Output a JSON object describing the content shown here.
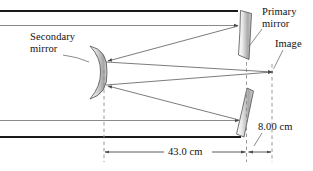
{
  "figure": {
    "type": "optics-ray-diagram",
    "labels": {
      "secondary_mirror_line1": "Secondary",
      "secondary_mirror_line2": "mirror",
      "primary_mirror_line1": "Primary",
      "primary_mirror_line2": "mirror",
      "image": "Image"
    },
    "dimensions": [
      {
        "name": "primary-to-secondary",
        "value": "43.0 cm"
      },
      {
        "name": "primary-to-image",
        "value": "8.00 cm"
      }
    ],
    "colors": {
      "ray_stroke": "#5a5a5a",
      "axis_stroke": "#1a1a1a",
      "mirror_fill_light": "#f2f2f2",
      "mirror_fill_dark": "#9a9a9a",
      "mirror_outline": "#4a4a4a",
      "dashed_stroke": "#8c8c8c",
      "text": "#111111"
    }
  }
}
